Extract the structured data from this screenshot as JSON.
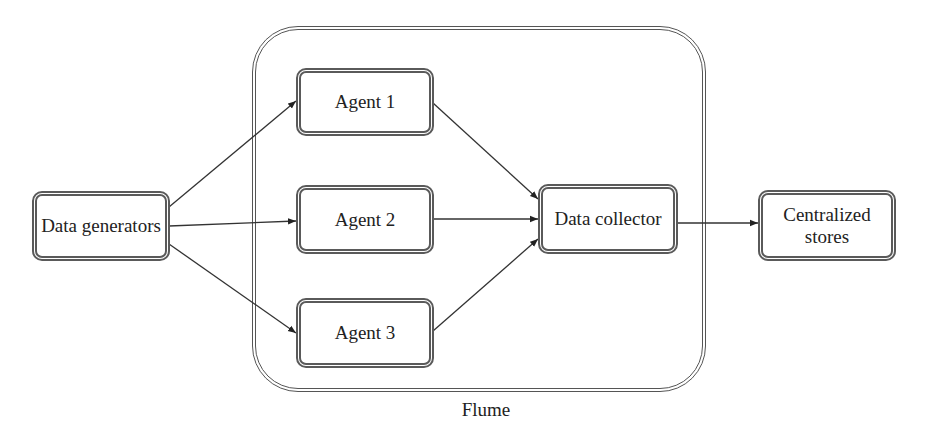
{
  "diagram": {
    "type": "flow",
    "container": {
      "label": "Flume"
    },
    "nodes": {
      "data_generators": {
        "label": "Data generators"
      },
      "agent1": {
        "label": "Agent 1"
      },
      "agent2": {
        "label": "Agent 2"
      },
      "agent3": {
        "label": "Agent 3"
      },
      "data_collector": {
        "label": "Data collector"
      },
      "centralized_stores": {
        "label": "Centralized stores"
      }
    },
    "edges": [
      {
        "from": "Data generators",
        "to": "Agent 1"
      },
      {
        "from": "Data generators",
        "to": "Agent 2"
      },
      {
        "from": "Data generators",
        "to": "Agent 3"
      },
      {
        "from": "Agent 1",
        "to": "Data collector"
      },
      {
        "from": "Agent 2",
        "to": "Data collector"
      },
      {
        "from": "Agent 3",
        "to": "Data collector"
      },
      {
        "from": "Data collector",
        "to": "Centralized stores"
      }
    ],
    "colors": {
      "stroke": "#555555",
      "text": "#222222",
      "background": "#ffffff"
    }
  }
}
